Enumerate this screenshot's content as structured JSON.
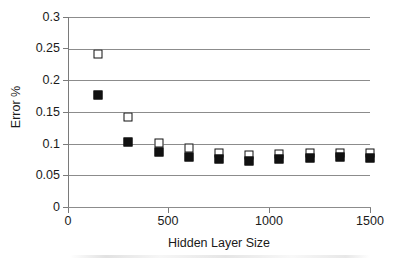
{
  "chart_data": {
    "type": "scatter",
    "title": "",
    "xlabel": "Hidden Layer Size",
    "ylabel": "Error %",
    "xlim": [
      0,
      1500
    ],
    "ylim": [
      0,
      0.3
    ],
    "grid": "horizontal",
    "legend_position": "none",
    "x_ticks": [
      "0",
      "500",
      "1000",
      "1500"
    ],
    "x_tick_values": [
      0,
      500,
      1000,
      1500
    ],
    "y_ticks": [
      "0",
      "0.05",
      "0.1",
      "0.15",
      "0.2",
      "0.25",
      "0.3"
    ],
    "y_tick_values": [
      0,
      0.05,
      0.1,
      0.15,
      0.2,
      0.25,
      0.3
    ],
    "x": [
      150,
      300,
      450,
      600,
      750,
      900,
      1050,
      1200,
      1350,
      1500
    ],
    "series": [
      {
        "name": "open-square-series",
        "marker": "open-square",
        "color": "#111111",
        "fill": "#ffffff",
        "values": [
          0.242,
          0.1425,
          0.1015,
          0.0925,
          0.0855,
          0.0825,
          0.0835,
          0.0845,
          0.0845,
          0.0845
        ]
      },
      {
        "name": "filled-square-series",
        "marker": "filled-square",
        "color": "#111111",
        "fill": "#111111",
        "values": [
          0.1765,
          0.1025,
          0.0875,
          0.0785,
          0.0765,
          0.0725,
          0.0765,
          0.0775,
          0.0785,
          0.0775
        ]
      }
    ]
  },
  "colors": {
    "gridline": "#8c8c8c",
    "axis": "#7a7a7a",
    "marker": "#111111",
    "background": "#ffffff",
    "text": "#1a1a1a"
  }
}
